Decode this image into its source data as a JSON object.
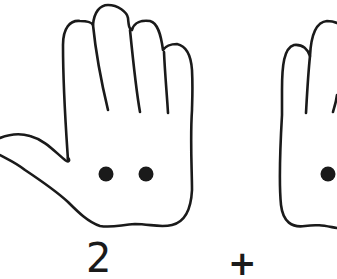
{
  "figure": {
    "left_hand": {
      "dots": 2,
      "number_label": "2"
    },
    "operator": "+",
    "right_hand": {
      "dots_visible": 1,
      "partially_cropped": true
    },
    "colors": {
      "stroke": "#1a1a1a",
      "dot": "#1a1a1a",
      "background": "#ffffff"
    }
  }
}
